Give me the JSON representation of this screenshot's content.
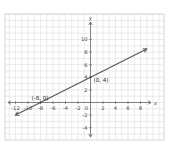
{
  "chart_data": {
    "type": "line",
    "title": "",
    "xlabel": "x",
    "ylabel": "y",
    "xlim": [
      -13,
      12
    ],
    "ylim": [
      -5,
      14
    ],
    "grid": true,
    "x_ticks": [
      -12,
      -10,
      -8,
      -6,
      -4,
      -2,
      2,
      4,
      6,
      8
    ],
    "y_ticks": [
      10,
      8,
      6,
      4,
      2,
      -2,
      -4
    ],
    "x_tick_labels": [
      "-12",
      "-10",
      "-8",
      "-6",
      "-4",
      "-2",
      "2",
      "4",
      "6",
      "8"
    ],
    "y_tick_labels": [
      "10",
      "8",
      "6",
      "4",
      "2",
      "-2",
      "-4"
    ],
    "origin_label": "0",
    "series": [
      {
        "name": "line",
        "color": "#555555",
        "points": [
          [
            -12,
            -2
          ],
          [
            9,
            8.5
          ]
        ],
        "equation": "y = 0.5x + 4"
      }
    ],
    "annotations": [
      {
        "text": "(-8, 0)",
        "x": -8,
        "y": 0
      },
      {
        "text": "(0, 4)",
        "x": 0,
        "y": 4
      }
    ]
  },
  "axes": {
    "x_label": "x",
    "y_label": "y",
    "origin": "0"
  }
}
